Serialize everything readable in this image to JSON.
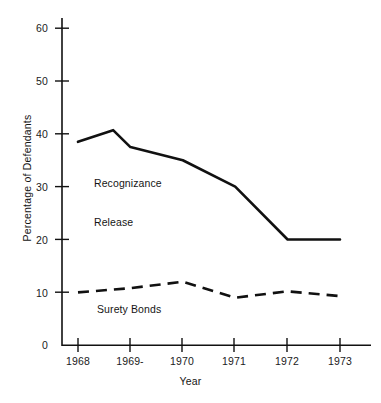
{
  "chart_data": {
    "type": "line",
    "title": "",
    "subtitle": "",
    "xlabel": "Year",
    "ylabel": "Percentage of Defendants",
    "categories": [
      "1968",
      "1969-",
      "1970",
      "1971",
      "1972",
      "1973"
    ],
    "x": [
      1968,
      1969,
      1970,
      1971,
      1972,
      1973
    ],
    "xlim": [
      1968,
      1973
    ],
    "ylim": [
      0,
      62
    ],
    "y_ticks": [
      0,
      10,
      20,
      30,
      40,
      50,
      60
    ],
    "y_tick_labels": [
      "0",
      "10",
      "20",
      "30",
      "40",
      "50",
      "60"
    ],
    "x_tick_labels": [
      "1968",
      "1969-",
      "1970",
      "1971",
      "1972",
      "1973"
    ],
    "grid": false,
    "legend": "inline-annotations",
    "series": [
      {
        "name": "Recognizance Release",
        "style": "solid",
        "color": "#111111",
        "label_position": "inline-left",
        "values": [
          38.5,
          37.5,
          35.0,
          30.0,
          20.0,
          20.0
        ],
        "peak_point": {
          "x": 1968.67,
          "y": 40.7
        }
      },
      {
        "name": "Surety Bonds",
        "style": "dashed",
        "color": "#111111",
        "label_position": "inline-below",
        "values": [
          10.0,
          10.8,
          12.0,
          9.0,
          10.2,
          9.3
        ]
      }
    ],
    "annotations": [
      {
        "id": "recognizance-release",
        "text": "Recognizance\nRelease"
      },
      {
        "id": "surety-bonds",
        "text": "Surety Bonds"
      }
    ]
  },
  "axes": {
    "y_label": "Percentage of Defendants",
    "x_label": "Year",
    "y_tick_0": "0",
    "y_tick_10": "10",
    "y_tick_20": "20",
    "y_tick_30": "30",
    "y_tick_40": "40",
    "y_tick_50": "50",
    "y_tick_60": "60",
    "x_tick_1968": "1968",
    "x_tick_1969": "1969-",
    "x_tick_1970": "1970",
    "x_tick_1971": "1971",
    "x_tick_1972": "1972",
    "x_tick_1973": "1973"
  },
  "annotations": {
    "recognizance_line1": "Recognizance",
    "recognizance_line2": "Release",
    "surety": "Surety Bonds"
  },
  "colors": {
    "ink": "#111111",
    "background": "#ffffff"
  }
}
